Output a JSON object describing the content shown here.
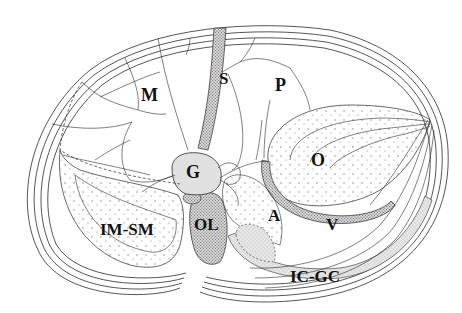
{
  "diagram": {
    "type": "anatomical-section-line-drawing",
    "labels": [
      {
        "id": "M",
        "text": "M",
        "x": 141,
        "y": 86,
        "size": 18
      },
      {
        "id": "S",
        "text": "S",
        "x": 219,
        "y": 70,
        "size": 17
      },
      {
        "id": "P",
        "text": "P",
        "x": 275,
        "y": 76,
        "size": 18
      },
      {
        "id": "G",
        "text": "G",
        "x": 186,
        "y": 167,
        "size": 18
      },
      {
        "id": "O",
        "text": "O",
        "x": 311,
        "y": 155,
        "size": 18
      },
      {
        "id": "IM-SM",
        "text": "IM-SM",
        "x": 100,
        "y": 224,
        "size": 17
      },
      {
        "id": "OL",
        "text": "OL",
        "x": 194,
        "y": 219,
        "size": 17
      },
      {
        "id": "A",
        "text": "A",
        "x": 268,
        "y": 210,
        "size": 17
      },
      {
        "id": "V",
        "text": "V",
        "x": 326,
        "y": 219,
        "size": 17
      },
      {
        "id": "IC-GC",
        "text": "IC-GC",
        "x": 290,
        "y": 271,
        "size": 17
      }
    ],
    "colors": {
      "line": "#2a2a2a",
      "light_fill": "#e4e4e4",
      "dense_fill": "#bdbdbd",
      "dot": "#7a7a7a",
      "background": "#ffffff"
    }
  }
}
